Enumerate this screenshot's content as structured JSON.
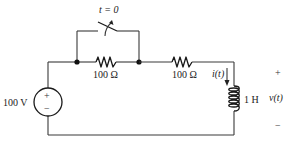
{
  "diagram": {
    "type": "electrical-circuit",
    "switch": {
      "label": "t = 0",
      "state": "closes at t=0, shorting first resistor"
    },
    "source": {
      "label": "100 V",
      "plus": "+",
      "minus": "−"
    },
    "resistor1": {
      "label": "100 Ω"
    },
    "resistor2": {
      "label": "100 Ω"
    },
    "current": {
      "label": "i(t)"
    },
    "inductor": {
      "label": "1 H"
    },
    "voltage": {
      "label": "v(t)",
      "plus": "+",
      "minus": "−"
    },
    "colors": {
      "wire": "#3a3a3a",
      "component": "#1a1a1a",
      "text": "#222222",
      "background": "#ffffff"
    }
  }
}
